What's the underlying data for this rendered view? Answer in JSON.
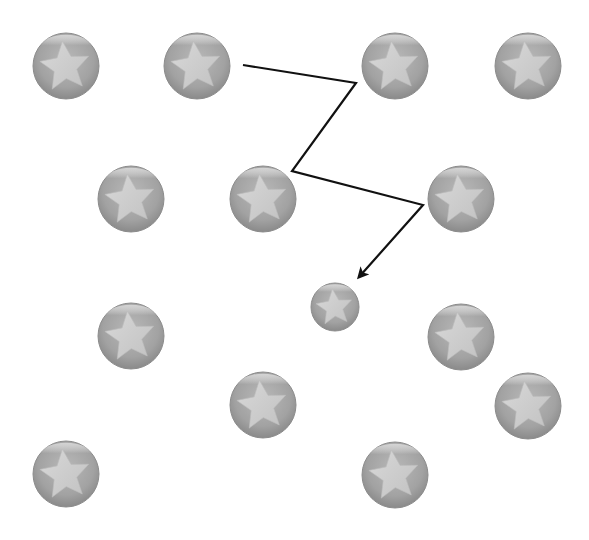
{
  "canvas": {
    "width": 589,
    "height": 540,
    "background": "#ffffff"
  },
  "colors": {
    "ball_outer": "#8f8f8f",
    "ball_mid": "#a9a9a9",
    "ball_highlight": "#d2d2d2",
    "star_fill": "#cfcfcf",
    "path_stroke": "#111111"
  },
  "balls": [
    {
      "cx": 66,
      "cy": 66,
      "r": 33
    },
    {
      "cx": 197,
      "cy": 66,
      "r": 33
    },
    {
      "cx": 395,
      "cy": 66,
      "r": 33
    },
    {
      "cx": 528,
      "cy": 66,
      "r": 33
    },
    {
      "cx": 131,
      "cy": 199,
      "r": 33
    },
    {
      "cx": 263,
      "cy": 199,
      "r": 33
    },
    {
      "cx": 461,
      "cy": 199,
      "r": 33
    },
    {
      "cx": 335,
      "cy": 307,
      "r": 24
    },
    {
      "cx": 131,
      "cy": 336,
      "r": 33
    },
    {
      "cx": 461,
      "cy": 337,
      "r": 33
    },
    {
      "cx": 263,
      "cy": 405,
      "r": 33
    },
    {
      "cx": 528,
      "cy": 406,
      "r": 33
    },
    {
      "cx": 66,
      "cy": 474,
      "r": 33
    },
    {
      "cx": 395,
      "cy": 475,
      "r": 33
    }
  ],
  "path": {
    "points": [
      [
        243,
        65
      ],
      [
        356,
        83
      ],
      [
        292,
        171
      ],
      [
        423,
        205
      ],
      [
        359,
        277
      ]
    ],
    "stroke_width": 2.2,
    "arrow_at_end": true
  }
}
